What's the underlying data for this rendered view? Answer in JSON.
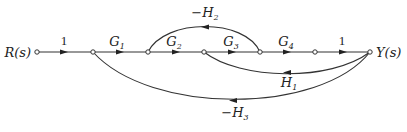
{
  "diagram": {
    "type": "signal-flow-graph",
    "input_label": "R(s)",
    "output_label": "Y(s)",
    "nodes": [
      {
        "id": "n1",
        "x": 37,
        "y": 52
      },
      {
        "id": "n2",
        "x": 93,
        "y": 52
      },
      {
        "id": "n3",
        "x": 148,
        "y": 52
      },
      {
        "id": "n4",
        "x": 204,
        "y": 52
      },
      {
        "id": "n5",
        "x": 260,
        "y": 52
      },
      {
        "id": "n6",
        "x": 315,
        "y": 52
      },
      {
        "id": "n7",
        "x": 370,
        "y": 52
      }
    ],
    "forward_branches": [
      {
        "from": "n1",
        "to": "n2",
        "gain": "1"
      },
      {
        "from": "n2",
        "to": "n3",
        "gain": "G",
        "sub": "1"
      },
      {
        "from": "n3",
        "to": "n4",
        "gain": "G",
        "sub": "2"
      },
      {
        "from": "n4",
        "to": "n5",
        "gain": "G",
        "sub": "3"
      },
      {
        "from": "n5",
        "to": "n6",
        "gain": "G",
        "sub": "4"
      },
      {
        "from": "n6",
        "to": "n7",
        "gain": "1"
      }
    ],
    "feedback_branches": [
      {
        "from": "n5",
        "to": "n3",
        "gain": "−H",
        "sub": "2"
      },
      {
        "from": "n7",
        "to": "n4",
        "gain": "H",
        "sub": "1"
      },
      {
        "from": "n7",
        "to": "n2",
        "gain": "−H",
        "sub": "3"
      }
    ]
  }
}
